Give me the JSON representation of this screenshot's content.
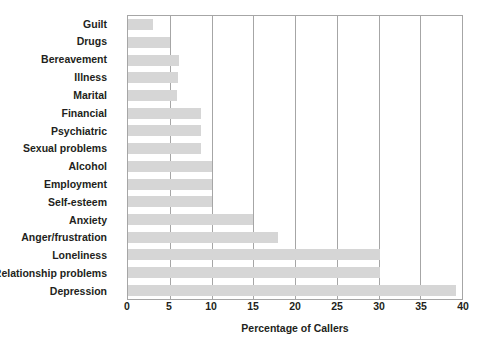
{
  "chart_data": {
    "type": "bar",
    "orientation": "horizontal",
    "title": "",
    "xlabel": "Percentage of Callers",
    "ylabel": "",
    "xlim": [
      0,
      40
    ],
    "xticks": [
      0,
      5,
      10,
      15,
      20,
      25,
      30,
      35,
      40
    ],
    "xtick_labels": [
      "0",
      "5",
      "10",
      "15",
      "20",
      "25",
      "30",
      "35",
      "40"
    ],
    "grid": "vertical",
    "legend": "none",
    "bar_color": "#d6d6d6",
    "grid_color": "#a6a6a6",
    "text_color": "#231f20",
    "categories": [
      "Guilt",
      "Drugs",
      "Bereavement",
      "Illness",
      "Marital",
      "Financial",
      "Psychiatric",
      "Sexual problems",
      "Alcohol",
      "Employment",
      "Self-esteem",
      "Anxiety",
      "Anger/frustration",
      "Loneliness",
      "Relationship problems",
      "Depression"
    ],
    "values": [
      3.0,
      5.0,
      6.1,
      6.0,
      5.9,
      8.8,
      8.7,
      8.7,
      10.0,
      10.0,
      10.0,
      15.0,
      18.0,
      30.2,
      30.2,
      39.3
    ]
  }
}
